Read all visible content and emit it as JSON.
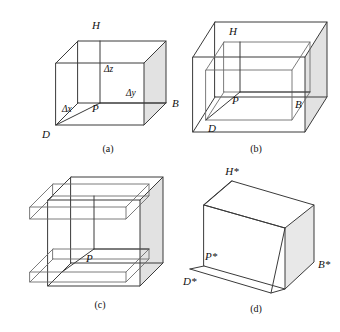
{
  "figure": {
    "background_color": "#ffffff",
    "line_color": "#3a3a3a",
    "shade_color": "#e2e2e2",
    "panel_count": 4
  },
  "panels": [
    {
      "id": "a",
      "caption": "(a)",
      "description": "cube with delta increments",
      "vertex_labels": [
        {
          "name": "H",
          "text": "H"
        },
        {
          "name": "B",
          "text": "B"
        },
        {
          "name": "D",
          "text": "D"
        },
        {
          "name": "P",
          "text": "P"
        }
      ],
      "dimension_labels": [
        {
          "name": "delta-z",
          "text": "Δz"
        },
        {
          "name": "delta-y",
          "text": "Δy"
        },
        {
          "name": "delta-x",
          "text": "Δx"
        }
      ]
    },
    {
      "id": "b",
      "caption": "(b)",
      "description": "outer cube with nested inner cube",
      "vertex_labels": [
        {
          "name": "H",
          "text": "H"
        },
        {
          "name": "B",
          "text": "B"
        },
        {
          "name": "D",
          "text": "D"
        },
        {
          "name": "P",
          "text": "P"
        }
      ],
      "dimension_labels": []
    },
    {
      "id": "c",
      "caption": "(c)",
      "description": "flattened box with nested wireframe",
      "vertex_labels": [
        {
          "name": "P",
          "text": "P"
        }
      ],
      "dimension_labels": []
    },
    {
      "id": "d",
      "caption": "(d)",
      "description": "sheared parallelepiped with starred vertices",
      "vertex_labels": [
        {
          "name": "H-star",
          "text": "H*"
        },
        {
          "name": "B-star",
          "text": "B*"
        },
        {
          "name": "D-star",
          "text": "D*"
        },
        {
          "name": "P-star",
          "text": "P*"
        }
      ],
      "dimension_labels": []
    }
  ]
}
